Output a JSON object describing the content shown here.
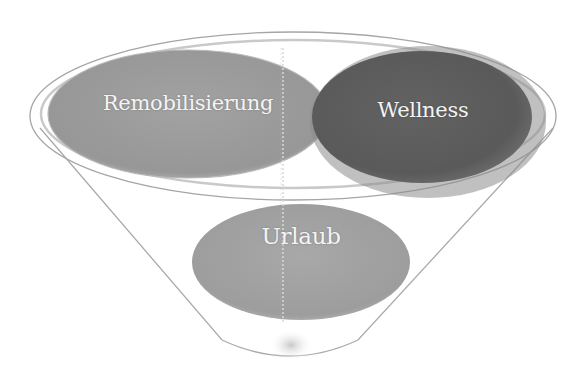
{
  "diagram": {
    "type": "funnel",
    "colors": {
      "background": "#ffffff",
      "funnel_outline": "#a8a8a8",
      "remobilisierung_fill": "#9c9c9c",
      "wellness_fill": "#5f5f5f",
      "wellness_halo": "#8a8a8a",
      "urlaub_fill": "#a3a3a3",
      "label_text": "#f4f4f4"
    },
    "items": [
      {
        "label": "Remobilisierung",
        "position": "top-left"
      },
      {
        "label": "Wellness",
        "position": "top-right"
      },
      {
        "label": "Urlaub",
        "position": "center-bottom"
      }
    ]
  }
}
